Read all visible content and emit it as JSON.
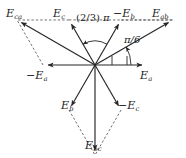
{
  "figure": {
    "name": "three-phase-phasor-diagram",
    "background": "#ffffff",
    "stroke_color": "#262626",
    "text_color": "#1a1a1a",
    "width": 186,
    "height": 158
  },
  "origin": {
    "x": 95,
    "y": 65
  },
  "phasors": [
    {
      "id": "Ea",
      "label": "E",
      "sub": "a",
      "neg": "",
      "angle_deg": 0,
      "length": 52,
      "style": "solid",
      "label_x": 140,
      "label_y": 70
    },
    {
      "id": "negEb",
      "label": "E",
      "sub": "b",
      "neg": "−",
      "angle_deg": 60,
      "length": 52,
      "style": "solid",
      "label_x": 113,
      "label_y": 8
    },
    {
      "id": "Ec",
      "label": "E",
      "sub": "c",
      "neg": "",
      "angle_deg": 120,
      "length": 52,
      "style": "solid",
      "label_x": 53,
      "label_y": 8
    },
    {
      "id": "negEa",
      "label": "E",
      "sub": "a",
      "neg": "−",
      "angle_deg": 180,
      "length": 52,
      "style": "solid",
      "label_x": 26,
      "label_y": 70
    },
    {
      "id": "Eb",
      "label": "E",
      "sub": "b",
      "neg": "",
      "angle_deg": 240,
      "length": 52,
      "style": "solid",
      "label_x": 61,
      "label_y": 100
    },
    {
      "id": "negEc",
      "label": "E",
      "sub": "c",
      "neg": "−",
      "angle_deg": 300,
      "length": 52,
      "style": "solid",
      "label_x": 118,
      "label_y": 100
    }
  ],
  "resultants": [
    {
      "id": "Eab",
      "label": "E",
      "sub": "ab",
      "neg": "",
      "angle_deg": 30,
      "length": 90,
      "style": "solid",
      "label_x": 152,
      "label_y": 8
    },
    {
      "id": "Ebc",
      "label": "E",
      "sub": "bc",
      "neg": "",
      "angle_deg": 270,
      "length": 90,
      "style": "solid",
      "label_x": 85,
      "label_y": 140
    },
    {
      "id": "Eca",
      "label": "E",
      "sub": "ca",
      "neg": "",
      "angle_deg": 150,
      "length": 90,
      "style": "solid",
      "label_x": 6,
      "label_y": 8
    }
  ],
  "construction_lines": [
    {
      "id": "dash-Ec-to-Eab",
      "from": "Ec",
      "to": "Eab",
      "style": "dashed"
    },
    {
      "id": "dash-negEb-to-Eab",
      "from": "negEb",
      "to": "Eab",
      "style": "dashed"
    },
    {
      "id": "dash-Ec-to-Eca",
      "from": "Ec",
      "to": "Eca",
      "style": "dashed"
    },
    {
      "id": "dash-negEa-to-Eca",
      "from": "negEa",
      "to": "Eca",
      "style": "dashed"
    },
    {
      "id": "dash-Eb-to-Ebc",
      "from": "Eb",
      "to": "Ebc",
      "style": "dashed"
    },
    {
      "id": "dash-negEc-to-Ebc",
      "from": "negEc",
      "to": "Ebc",
      "style": "dashed"
    }
  ],
  "angles": [
    {
      "id": "two-thirds-pi",
      "text_prefix": "(2/3)",
      "text_symbol": "π",
      "full_text": "(2/3) π",
      "from_deg": 60,
      "to_deg": 120,
      "sweep": "counterclockwise",
      "radius": 24,
      "label_x": 76,
      "label_y": 13
    },
    {
      "id": "pi-over-six",
      "text_prefix": "",
      "text_symbol": "π/6",
      "full_text": "π/6",
      "from_deg": 0,
      "to_deg": 30,
      "sweep": "counterclockwise",
      "radius": 36,
      "label_x": 124,
      "label_y": 35
    }
  ],
  "tick_marks": [
    {
      "id": "tick-axis-1",
      "x": 112,
      "y": 65,
      "len": 9
    },
    {
      "id": "tick-axis-2",
      "x": 127,
      "y": 65,
      "len": 9
    }
  ]
}
